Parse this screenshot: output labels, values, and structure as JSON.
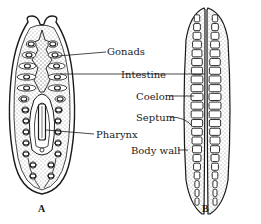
{
  "diagram": {
    "figure_a": {
      "caption": "A",
      "subject": "flatworm-body-plan",
      "labels": {
        "gonads": "Gonads",
        "intestine": "Intestine",
        "pharynx": "Pharynx"
      }
    },
    "figure_b": {
      "caption": "B",
      "subject": "segmented-worm-body-plan",
      "labels": {
        "coelom": "Coelom",
        "septum": "Septum",
        "body_wall": "Body wall"
      }
    },
    "colors": {
      "ink": "#1a1a1a",
      "background": "#ffffff"
    }
  }
}
